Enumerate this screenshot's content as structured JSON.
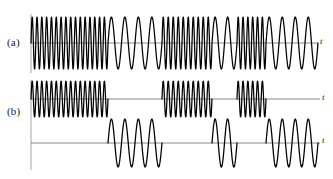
{
  "figure": {
    "background_color": "#ffffff",
    "wave_color": "#000000",
    "axis_color": "#7b7b7b"
  },
  "panels": [
    {
      "id": "a",
      "label": "(a)",
      "axis_label": "t",
      "description": "Composite FSK signal alternating between mark and space frequencies",
      "baseline_y": 43,
      "vertical_axis_x": 31,
      "vertical_axis_top": 14,
      "vertical_axis_bottom": 73,
      "axis_start_x": 31,
      "axis_end_x": 318,
      "amplitude": 26
    },
    {
      "id": "b-upper",
      "label": "(b)",
      "axis_label": "t",
      "description": "Mark (high-frequency) component bursts",
      "baseline_y": 99,
      "vertical_axis_x": 31,
      "vertical_axis_top": 80,
      "vertical_axis_bottom": 170,
      "axis_start_x": 31,
      "axis_end_x": 320,
      "amplitude": 18
    },
    {
      "id": "b-lower",
      "label": "",
      "axis_label": "t",
      "description": "Space (low-frequency) component bursts",
      "baseline_y": 143,
      "vertical_axis_x": 31,
      "axis_start_x": 31,
      "axis_end_x": 320,
      "amplitude": 24
    }
  ],
  "chart_data": {
    "type": "line",
    "xlabel": "t",
    "ylabel": "",
    "grid": false,
    "legend_position": "none",
    "series": [
      {
        "name": "(a) composite FSK signal",
        "panel": "a",
        "segments": [
          {
            "x_start": 31,
            "x_end": 108,
            "frequency": "high",
            "cycles": 16,
            "symbol": "mark"
          },
          {
            "x_start": 108,
            "x_end": 162,
            "frequency": "low",
            "cycles": 4,
            "symbol": "space"
          },
          {
            "x_start": 162,
            "x_end": 212,
            "frequency": "high",
            "cycles": 10,
            "symbol": "mark"
          },
          {
            "x_start": 212,
            "x_end": 237,
            "frequency": "low",
            "cycles": 2,
            "symbol": "space"
          },
          {
            "x_start": 237,
            "x_end": 266,
            "frequency": "high",
            "cycles": 6,
            "symbol": "mark"
          },
          {
            "x_start": 266,
            "x_end": 318,
            "frequency": "low",
            "cycles": 4,
            "symbol": "space"
          }
        ]
      },
      {
        "name": "(b) mark component",
        "panel": "b-upper",
        "bursts": [
          {
            "x_start": 31,
            "x_end": 108,
            "cycles": 16
          },
          {
            "x_start": 162,
            "x_end": 212,
            "cycles": 10
          },
          {
            "x_start": 237,
            "x_end": 266,
            "cycles": 6
          }
        ]
      },
      {
        "name": "(b) space component",
        "panel": "b-lower",
        "bursts": [
          {
            "x_start": 108,
            "x_end": 162,
            "cycles": 4
          },
          {
            "x_start": 212,
            "x_end": 237,
            "cycles": 2
          },
          {
            "x_start": 266,
            "x_end": 318,
            "cycles": 4
          }
        ]
      }
    ]
  }
}
